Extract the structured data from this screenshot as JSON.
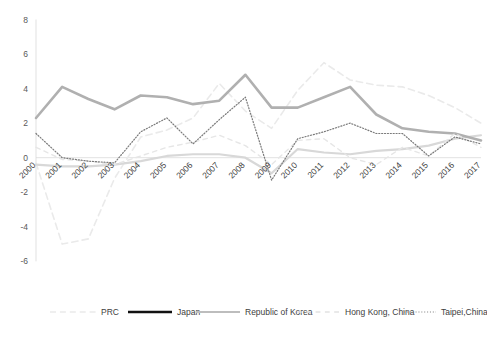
{
  "chart_data": {
    "type": "line",
    "title": "",
    "subtitle": "",
    "xlabel": "",
    "ylabel": "",
    "grid": false,
    "legend_position": "bottom",
    "ylim": [
      -6,
      8
    ],
    "yticks": [
      "8",
      "6",
      "4",
      "2",
      "0",
      "-2",
      "-4",
      "-6"
    ],
    "ytick_values": [
      8,
      6,
      4,
      2,
      0,
      -2,
      -4,
      -6
    ],
    "categories": [
      "2000",
      "2001",
      "2002",
      "2003",
      "2004",
      "2005",
      "2006",
      "2007",
      "2008",
      "2009",
      "2010",
      "2011",
      "2012",
      "2013",
      "2014",
      "2015",
      "2016",
      "2017"
    ],
    "series": [
      {
        "name": "PRC",
        "color": "#eaeaea",
        "style": "dashed-light",
        "width": 1.6,
        "values": [
          -0.3,
          -5.0,
          -4.7,
          -1.2,
          1.2,
          1.6,
          2.3,
          4.3,
          2.7,
          1.7,
          3.9,
          5.5,
          4.5,
          4.2,
          4.1,
          3.6,
          2.9,
          2.0
        ]
      },
      {
        "name": "Japan",
        "color": "#d8d8d8",
        "style": "solid-thick-light",
        "width": 2.2,
        "values": [
          -0.4,
          -0.5,
          -0.5,
          -0.4,
          -0.2,
          0.1,
          0.2,
          0.2,
          0.0,
          -0.9,
          0.5,
          0.3,
          0.2,
          0.4,
          0.5,
          0.7,
          1.1,
          1.3
        ]
      },
      {
        "name": "Republic of Korea",
        "color": "#b0b0b0",
        "style": "solid-thick",
        "width": 2.6,
        "values": [
          2.3,
          4.1,
          3.4,
          2.8,
          3.6,
          3.5,
          3.1,
          3.3,
          4.8,
          2.9,
          2.9,
          3.5,
          4.1,
          2.5,
          1.7,
          1.5,
          1.4,
          1.0
        ]
      },
      {
        "name": "Hong Kong, China",
        "color": "#e6e6e6",
        "style": "dashed",
        "width": 1.4,
        "values": [
          0.6,
          -0.1,
          -0.2,
          -0.4,
          0.1,
          0.6,
          0.9,
          1.3,
          0.7,
          -0.4,
          1.0,
          1.1,
          0.0,
          -0.4,
          0.6,
          0.1,
          1.4,
          0.6
        ]
      },
      {
        "name": "Taipei,China",
        "color": "#7a7a7a",
        "style": "dotted",
        "width": 1.2,
        "values": [
          1.4,
          0.0,
          -0.2,
          -0.3,
          1.5,
          2.3,
          0.8,
          2.2,
          3.5,
          -1.3,
          1.1,
          1.5,
          2.0,
          1.4,
          1.4,
          0.1,
          1.2,
          0.8
        ]
      }
    ],
    "legend": [
      {
        "label": "PRC",
        "color": "#eaeaea",
        "style": "dashed-light"
      },
      {
        "label": "Japan",
        "color": "#111111",
        "style": "solid-thick"
      },
      {
        "label": "Republic of Korea",
        "color": "#bdbdbd",
        "style": "solid"
      },
      {
        "label": "Hong Kong, China",
        "color": "#e2e2e2",
        "style": "dashed"
      },
      {
        "label": "Taipei,China",
        "color": "#8a8a8a",
        "style": "dotted"
      }
    ],
    "caption": ""
  },
  "colors": {
    "axis": "#d9d9d9",
    "tick_text": "#595959",
    "background": "#ffffff"
  }
}
